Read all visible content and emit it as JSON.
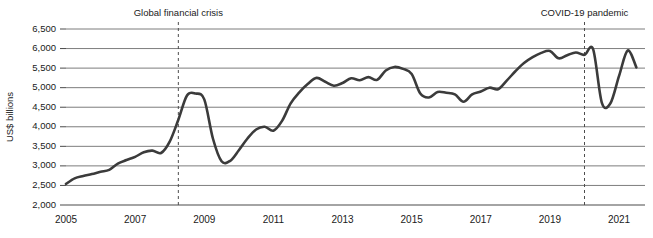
{
  "chart_data": {
    "type": "line",
    "title": "",
    "xlabel": "",
    "ylabel": "US$ billions",
    "ylim": [
      2000,
      6500
    ],
    "xlim": [
      2005.0,
      2021.75
    ],
    "grid": true,
    "legend": "none",
    "y_ticks": [
      "2,000",
      "2,500",
      "3,000",
      "3,500",
      "4,000",
      "4,500",
      "5,000",
      "5,500",
      "6,000",
      "6,500"
    ],
    "y_tick_values": [
      2000,
      2500,
      3000,
      3500,
      4000,
      4500,
      5000,
      5500,
      6000,
      6500
    ],
    "x_ticks": [
      "2005",
      "2007",
      "2009",
      "2011",
      "2013",
      "2015",
      "2017",
      "2019",
      "2021"
    ],
    "x_tick_values": [
      2005,
      2007,
      2009,
      2011,
      2013,
      2015,
      2017,
      2019,
      2021
    ],
    "annotations": [
      {
        "label": "Global financial crisis",
        "x": 2008.25
      },
      {
        "label": "COVID-19 pandemic",
        "x": 2020.0
      }
    ],
    "series": [
      {
        "name": "World merchandise trade",
        "color": "#3b3b3b",
        "x": [
          2005.0,
          2005.25,
          2005.5,
          2005.75,
          2006.0,
          2006.25,
          2006.5,
          2006.75,
          2007.0,
          2007.25,
          2007.5,
          2007.75,
          2008.0,
          2008.25,
          2008.5,
          2008.75,
          2009.0,
          2009.25,
          2009.5,
          2009.75,
          2010.0,
          2010.25,
          2010.5,
          2010.75,
          2011.0,
          2011.25,
          2011.5,
          2011.75,
          2012.0,
          2012.25,
          2012.5,
          2012.75,
          2013.0,
          2013.25,
          2013.5,
          2013.75,
          2014.0,
          2014.25,
          2014.5,
          2014.75,
          2015.0,
          2015.25,
          2015.5,
          2015.75,
          2016.0,
          2016.25,
          2016.5,
          2016.75,
          2017.0,
          2017.25,
          2017.5,
          2017.75,
          2018.0,
          2018.25,
          2018.5,
          2018.75,
          2019.0,
          2019.25,
          2019.5,
          2019.75,
          2020.0,
          2020.25,
          2020.5,
          2020.75,
          2021.0,
          2021.25,
          2021.5
        ],
        "values": [
          2540,
          2680,
          2740,
          2790,
          2850,
          2900,
          3060,
          3150,
          3230,
          3350,
          3390,
          3330,
          3620,
          4180,
          4800,
          4850,
          4700,
          3700,
          3120,
          3130,
          3400,
          3700,
          3930,
          4000,
          3900,
          4150,
          4600,
          4880,
          5100,
          5250,
          5150,
          5050,
          5120,
          5240,
          5190,
          5270,
          5200,
          5440,
          5530,
          5480,
          5350,
          4850,
          4750,
          4890,
          4870,
          4830,
          4640,
          4830,
          4900,
          5000,
          4960,
          5180,
          5420,
          5630,
          5780,
          5890,
          5940,
          5750,
          5830,
          5900,
          5840,
          5980,
          4620,
          4600,
          5300,
          5950,
          5520
        ]
      }
    ]
  }
}
